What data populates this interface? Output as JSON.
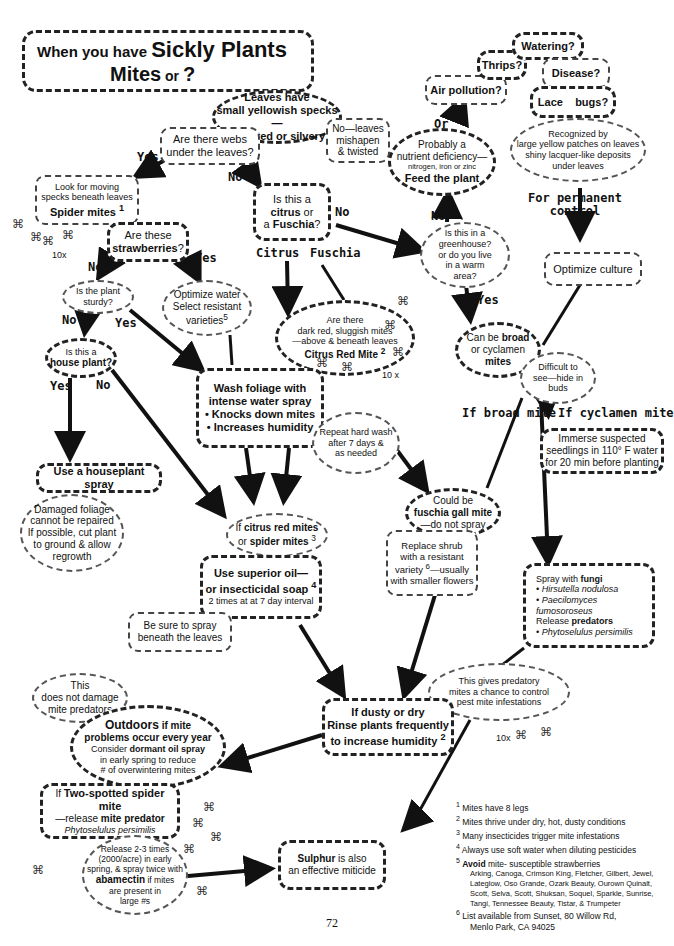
{
  "title": {
    "line1_prefix": "When you have ",
    "line1_main": "Sickly Plants",
    "line2_main": "Mites",
    "line2_suffix": " or ",
    "line2_q": "?"
  },
  "nodes": {
    "leaves_specks": {
      "l1": "Leaves have",
      "l2": "small yellowish specks—",
      "l3": "are wilted or silvery?"
    },
    "webs": {
      "l1": "Are there webs",
      "l2": "under the leaves?"
    },
    "mishapen": {
      "l1": "No—leaves",
      "l2": "mishapen",
      "l3": "& twisted"
    },
    "look_moving": {
      "l1": "Look for moving",
      "l2": "specks beneath leaves",
      "l3": "Spider mites",
      "sup": "1"
    },
    "strawberries": {
      "l1": "Are these",
      "l2": "strawberries",
      "l3": "?"
    },
    "citrus_fuschia": {
      "l1": "Is this a",
      "l2b": "citrus",
      "l2": " or",
      "l3a": "a ",
      "l3b": "Fuschia",
      "l3c": "?"
    },
    "plant_sturdy": {
      "l1": "Is the plant",
      "l2": "sturdy?"
    },
    "optimize_water": {
      "l1": "Optimize water",
      "l2": "Select resistant",
      "l3": "varieties",
      "sup": "5"
    },
    "house_plant": {
      "l1": "Is this a",
      "l2": "house plant?"
    },
    "citrus_red": {
      "l1": "Are there",
      "l2": "dark red, sluggish mites",
      "l3": "—above & beneath leaves",
      "l4": "Citrus Red Mite",
      "sup": "2"
    },
    "wash_foliage": {
      "l1": "Wash foliage with",
      "l2": "intense water spray",
      "l3": "• Knocks down mites",
      "l4": "• Increases humidity"
    },
    "repeat_wash": {
      "l1": "Repeat hard wash",
      "l2": "after 7 days &",
      "l3": "as needed"
    },
    "houseplant_spray": {
      "l1": "Use a houseplant spray"
    },
    "damaged_foliage": {
      "l1": "Damaged foliage",
      "l2": "cannot be repaired",
      "l3": "If possible, cut plant",
      "l4": "to ground & allow",
      "l5": "regrowth"
    },
    "if_citrus_red": {
      "l1a": "If ",
      "l1b": "citrus red mites",
      "l2a": "or ",
      "l2b": "spider mites",
      "sup": "3"
    },
    "superior_oil": {
      "l1": "Use superior oil—",
      "l2": "or insecticidal soap",
      "sup": "4",
      "l3": "2 times at at 7 day  interval"
    },
    "spray_beneath": {
      "l1": "Be sure to spray",
      "l2": "beneath the leaves"
    },
    "greenhouse": {
      "l1": "Is this in a",
      "l2": "greenhouse?",
      "l3": "or do you live",
      "l4": "in a warm",
      "l5": "area?"
    },
    "nutrient": {
      "l1": "Probably a",
      "l2": "nutrient deficiency—",
      "l3": "nitrogen, iron or zinc",
      "l4": "Feed the plant"
    },
    "air_pollution": {
      "l1": "Air pollution?"
    },
    "thrips": {
      "l1": "Thrips?"
    },
    "watering": {
      "l1": "Watering?"
    },
    "disease": {
      "l1": "Disease?"
    },
    "lace_bugs": {
      "l1": "Lace    bugs?"
    },
    "recognized": {
      "l1": "Recognized by",
      "l2": "large yellow patches on leaves",
      "l3": "shiny lacquer-like deposits",
      "l4": "under leaves"
    },
    "permanent": {
      "l1": "For permanent",
      "l2": "control"
    },
    "optimize_culture": {
      "l1": "Optimize culture"
    },
    "broad_cyclamen": {
      "l1a": "Can be ",
      "l1b": "broad",
      "l2": "or cyclamen",
      "l3": "mites"
    },
    "difficult": {
      "l1": "Difficult to",
      "l2": "see—hide in",
      "l3": "buds"
    },
    "immerse": {
      "l1": "Immerse suspected",
      "l2": "seedlings in 110° F water",
      "l3": "for 20 min before planting"
    },
    "fuschia_gall": {
      "l1": "Could be",
      "l2": "fuschia gall mite",
      "l3": "—do not spray"
    },
    "replace_shrub": {
      "l1": "Replace shrub",
      "l2": "with a resistant",
      "l3a": "variety ",
      "sup": "6",
      "l3b": "—usually",
      "l4": "with smaller flowers"
    },
    "spray_fungi": {
      "l1a": "Spray with ",
      "l1b": "fungi",
      "l2": "• Hirsutella nodulosa",
      "l3": "•  Paecilomyces fumosoroseus",
      "l4a": "Release ",
      "l4b": "predators",
      "l5": "• Phytoselulus persimilis"
    },
    "predatory_chance": {
      "l1": "This gives predatory",
      "l2": "mites a chance to control",
      "l3": "pest mite infestations"
    },
    "dusty_dry": {
      "l1": "If dusty or dry",
      "l2": "Rinse plants frequently",
      "l3": "to increase humidity",
      "sup": "2"
    },
    "not_damage": {
      "l1": "This",
      "l2": "does not damage",
      "l3": "mite predators"
    },
    "outdoors": {
      "l1a": "Outdoors",
      "l1b": " if mite",
      "l2": "problems occur every year",
      "l3a": "Consider ",
      "l3b": "dormant oil spray",
      "l4": "in early spring to reduce",
      "l5": "# of overwintering mites"
    },
    "two_spotted": {
      "l1a": "If ",
      "l1b": "Two-spotted spider mite",
      "l2a": "—release ",
      "l2b": "mite predator",
      "l3": "Phytoselulus persimilis"
    },
    "release_times": {
      "l1": "Release 2-3 times",
      "l2": "(2000/acre) in early",
      "l3": "spring,  & spray twice with",
      "l4a": "abamectin",
      "l4b": "  if mites",
      "l5": "are present in",
      "l6": "large #s"
    },
    "sulphur": {
      "l1a": "Sulphur",
      "l1b": " is also",
      "l2": "an effective miticide"
    }
  },
  "labels": {
    "yes": "Yes",
    "no": "No",
    "or": "Or",
    "citrus": "Citrus",
    "fuschia": "Fuschia",
    "if_broad": "If broad mite",
    "if_cyclamen": "If cyclamen mite",
    "mag10x": "10x",
    "mag10x_sp": "10 x"
  },
  "footnotes": [
    {
      "num": "1",
      "text": "Mites have 8  legs"
    },
    {
      "num": "2",
      "text": "Mites thrive under dry, hot, dusty conditions"
    },
    {
      "num": "3",
      "text": "Many insecticides trigger mite infestations"
    },
    {
      "num": "4",
      "text": "Always use soft water when diluting pesticides"
    },
    {
      "num": "5",
      "bold": "Avoid",
      "text": " mite- susceptible strawberries",
      "list": "Arking, Canoga, Crimson King, Fletcher, Gilbert, Jewel, Lateglow, Oso Grande, Ozark Beauty, Ourown Quinalt, Scott, Selva, Scott, Shuksan, Soquel, Sparkle, Sunrise, Tangi, Tennessee Beauty, Tistar, & Trumpeter"
    },
    {
      "num": "6",
      "text": "List available from Sunset, 80 Willow Rd,",
      "text2": "Menlo Park,  CA  94025"
    }
  ],
  "page_number": "72",
  "icons": {
    "mite": "⌘"
  }
}
